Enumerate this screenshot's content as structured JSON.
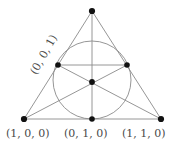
{
  "figure": {
    "kind": "geometry-diagram",
    "width": 185,
    "height": 148,
    "background_color": "#ffffff",
    "line_color": "#808080",
    "point_color": "#111111",
    "label_color": "#4a4a4a"
  },
  "labels": {
    "bottom_left": "(1, 0, 0)",
    "bottom_middle": "(0, 1, 0)",
    "bottom_right": "(1, 1, 0)",
    "upper_left_rotated": "(0, 0, 1)"
  },
  "geometry": {
    "triangle": {
      "apex": {
        "x": 92,
        "y": 11
      },
      "bottom_left": {
        "x": 24,
        "y": 119
      },
      "bottom_right": {
        "x": 161,
        "y": 119
      }
    },
    "midpoints": {
      "left_edge": {
        "x": 58,
        "y": 65
      },
      "right_edge": {
        "x": 127,
        "y": 65
      },
      "bottom_edge": {
        "x": 92,
        "y": 119
      }
    },
    "centroid": {
      "x": 92,
      "y": 82
    },
    "incircle": {
      "cx": 92,
      "cy": 80,
      "r": 39
    },
    "point_radius": 2.6
  }
}
